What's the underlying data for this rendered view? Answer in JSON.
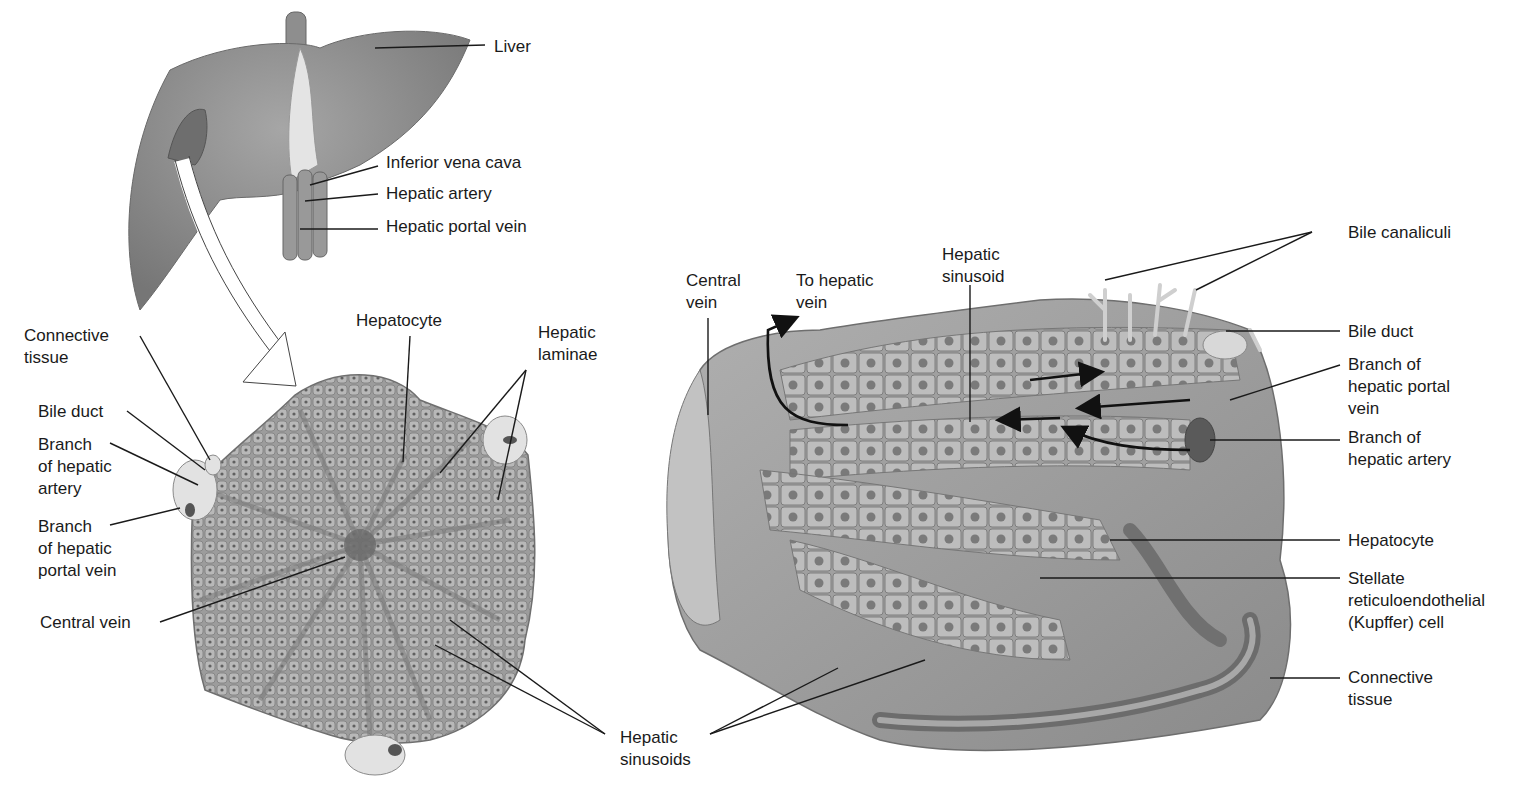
{
  "diagram": {
    "colors": {
      "tissue": "#8c8c8c",
      "tissue_light": "#b5b5b5",
      "tissue_dark": "#5e5e5e",
      "leader": "#1a1a1a",
      "background": "#ffffff"
    }
  },
  "gross_liver": {
    "labels": [
      {
        "id": "liver",
        "text": "Liver"
      },
      {
        "id": "ivc",
        "text": "Inferior vena cava"
      },
      {
        "id": "hepatic_artery",
        "text": "Hepatic artery"
      },
      {
        "id": "portal_vein",
        "text": "Hepatic portal vein"
      }
    ]
  },
  "lobule_section": {
    "labels": [
      {
        "id": "connective_tissue",
        "lines": [
          "Connective",
          "tissue"
        ]
      },
      {
        "id": "bile_duct",
        "lines": [
          "Bile duct"
        ]
      },
      {
        "id": "branch_artery",
        "lines": [
          "Branch",
          "of hepatic",
          "artery"
        ]
      },
      {
        "id": "branch_portal",
        "lines": [
          "Branch",
          "of hepatic",
          "portal vein"
        ]
      },
      {
        "id": "central_vein",
        "lines": [
          "Central vein"
        ]
      },
      {
        "id": "hepatocyte",
        "lines": [
          "Hepatocyte"
        ]
      },
      {
        "id": "hepatic_laminae",
        "lines": [
          "Hepatic",
          "laminae"
        ]
      },
      {
        "id": "hepatic_sinusoids",
        "lines": [
          "Hepatic",
          "sinusoids"
        ]
      }
    ]
  },
  "lobule_3d": {
    "labels": [
      {
        "id": "central_vein",
        "lines": [
          "Central",
          "vein"
        ]
      },
      {
        "id": "to_hepatic_vein",
        "lines": [
          "To hepatic",
          "vein"
        ]
      },
      {
        "id": "hepatic_sinusoid",
        "lines": [
          "Hepatic",
          "sinusoid"
        ]
      },
      {
        "id": "bile_canaliculi",
        "lines": [
          "Bile canaliculi"
        ]
      },
      {
        "id": "bile_duct",
        "lines": [
          "Bile duct"
        ]
      },
      {
        "id": "branch_portal",
        "lines": [
          "Branch of",
          "hepatic portal",
          "vein"
        ]
      },
      {
        "id": "branch_artery",
        "lines": [
          "Branch of",
          "hepatic artery"
        ]
      },
      {
        "id": "hepatocyte",
        "lines": [
          "Hepatocyte"
        ]
      },
      {
        "id": "kupffer",
        "lines": [
          "Stellate",
          "reticuloendothelial",
          "(Kupffer) cell"
        ]
      },
      {
        "id": "connective_tissue",
        "lines": [
          "Connective",
          "tissue"
        ]
      }
    ]
  }
}
